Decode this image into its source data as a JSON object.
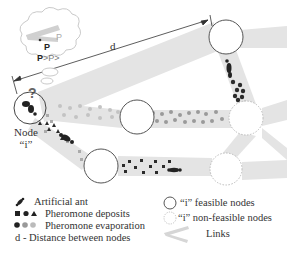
{
  "diagram": {
    "distance_label": "d",
    "node_i_label_line1": "Node",
    "node_i_label_line2": "“i”",
    "thought_bubble": {
      "p1": "P",
      "p2": "P",
      "comparison": "P>P>"
    },
    "colors": {
      "link": "#e3e3e3",
      "deposit": "#2b2b2b",
      "evaporation_light": "#a8a8a8",
      "node_stroke": "#555555",
      "nonfeasible_stroke": "#bbbbbb"
    }
  },
  "legend": {
    "left": [
      {
        "icon": "ant-icon",
        "label": "Artificial ant"
      },
      {
        "icon": "deposit-shapes-icon",
        "label": "Pheromone deposits"
      },
      {
        "icon": "evaporation-dots-icon",
        "label": "Pheromone evaporation"
      },
      {
        "icon": "",
        "label": "d - Distance between nodes"
      }
    ],
    "right": [
      {
        "icon": "feasible-node-icon",
        "label": "“i” feasible nodes"
      },
      {
        "icon": "nonfeasible-node-icon",
        "label": "“i” non-feasible nodes"
      },
      {
        "icon": "link-icon",
        "label": "Links"
      }
    ]
  }
}
